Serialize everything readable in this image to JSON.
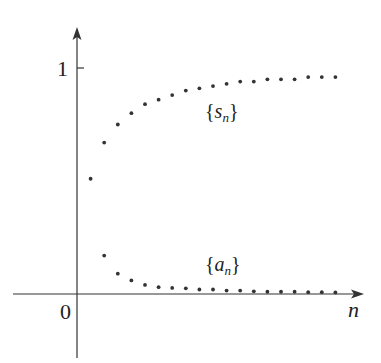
{
  "chart_data": {
    "type": "scatter",
    "title": "",
    "xlabel": "n",
    "ylabel": "",
    "y_ticks": [
      {
        "value": 1,
        "label": "1"
      }
    ],
    "origin_label": "0",
    "grid": false,
    "series": [
      {
        "name": "{s_n}",
        "label_main": "s",
        "label_sub": "n",
        "x": [
          1,
          2,
          3,
          4,
          5,
          6,
          7,
          8,
          9,
          10,
          11,
          12,
          13,
          14,
          15,
          16,
          17,
          18,
          19
        ],
        "values": [
          0.51,
          0.67,
          0.75,
          0.8,
          0.84,
          0.86,
          0.88,
          0.9,
          0.91,
          0.92,
          0.93,
          0.94,
          0.94,
          0.95,
          0.95,
          0.95,
          0.96,
          0.96,
          0.96
        ]
      },
      {
        "name": "{a_n}",
        "label_main": "a",
        "label_sub": "n",
        "x": [
          2,
          3,
          4,
          5,
          6,
          7,
          8,
          9,
          10,
          11,
          12,
          13,
          14,
          15,
          16,
          17,
          18,
          19
        ],
        "values": [
          0.17,
          0.09,
          0.06,
          0.04,
          0.03,
          0.027,
          0.025,
          0.02,
          0.02,
          0.015,
          0.015,
          0.012,
          0.01,
          0.01,
          0.01,
          0.008,
          0.008,
          0.007
        ]
      }
    ],
    "xlim": [
      0,
      20
    ],
    "ylim": [
      -0.28,
      1.17
    ]
  }
}
